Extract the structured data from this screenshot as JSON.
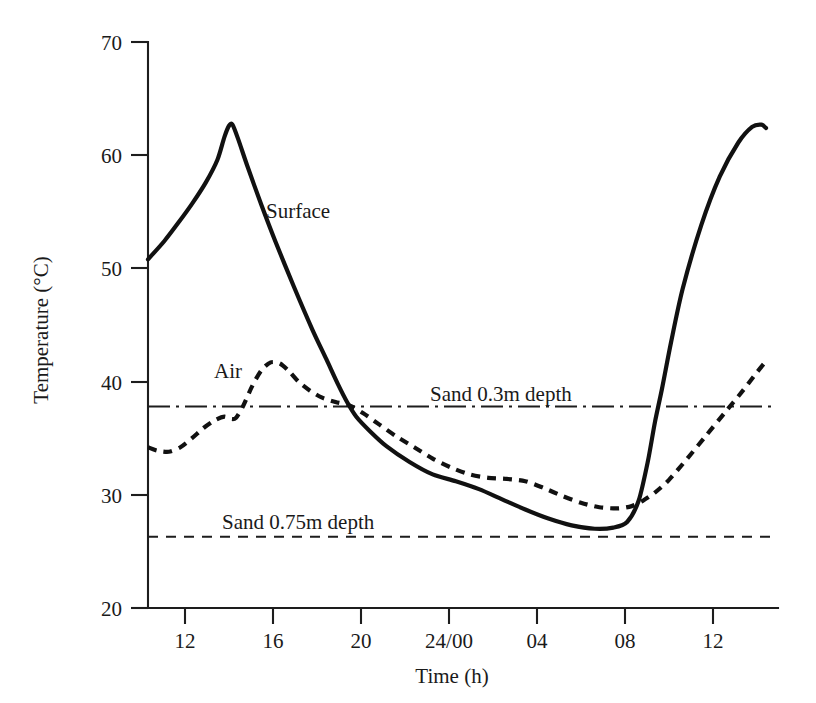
{
  "chart_data": {
    "type": "line",
    "title": "",
    "xlabel": "Time (h)",
    "ylabel": "Temperature (°C)",
    "xlim": [
      10.3,
      13.3
    ],
    "ylim": [
      20,
      70
    ],
    "grid": false,
    "legend": "inline-annotations",
    "x_tick_labels": [
      "12",
      "16",
      "20",
      "24/00",
      "04",
      "08",
      "12"
    ],
    "x_tick_hours": [
      12,
      16,
      20,
      24,
      28,
      32,
      36
    ],
    "y_tick_labels": [
      "20",
      "30",
      "40",
      "50",
      "60",
      "70"
    ],
    "y_tick_values": [
      20,
      30,
      40,
      50,
      60,
      70
    ],
    "series": [
      {
        "name": "Surface",
        "style": "solid",
        "label_text": "Surface",
        "x": [
          10.3,
          11.0,
          11.6,
          12.2,
          12.8,
          13.3,
          13.6,
          13.8,
          13.95,
          14.2,
          14.6,
          15.2,
          15.8,
          16.6,
          17.4,
          18.0,
          18.5,
          18.9,
          19.3,
          19.9,
          20.6,
          21.6,
          22.6,
          23.6,
          24.6,
          25.6,
          26.6,
          27.6,
          28.6,
          29.6,
          30.4,
          31.0,
          31.5,
          31.9,
          32.2,
          32.5,
          32.9,
          33.4,
          34.2,
          35.0,
          35.8,
          36.4,
          36.8,
          37.0
        ],
        "y": [
          50.8,
          52.4,
          54.0,
          55.7,
          57.6,
          59.6,
          61.6,
          62.6,
          62.7,
          61.4,
          59.0,
          55.6,
          52.4,
          48.4,
          44.6,
          42.0,
          39.8,
          38.2,
          36.9,
          35.6,
          34.3,
          32.9,
          31.8,
          31.2,
          30.5,
          29.6,
          28.7,
          27.9,
          27.3,
          27.0,
          27.1,
          27.6,
          29.5,
          33.0,
          36.4,
          39.3,
          43.5,
          48.2,
          53.8,
          58.1,
          61.1,
          62.5,
          62.7,
          62.4
        ]
      },
      {
        "name": "Air",
        "style": "dashed",
        "label_text": "Air",
        "x": [
          10.3,
          10.7,
          11.2,
          11.7,
          12.2,
          12.7,
          13.2,
          13.6,
          13.9,
          14.1,
          14.4,
          14.8,
          15.2,
          15.6,
          16.0,
          16.4,
          16.8,
          17.3,
          17.8,
          18.4,
          19.0,
          19.6,
          20.3,
          21.0,
          21.8,
          22.6,
          23.4,
          24.2,
          25.0,
          25.8,
          26.6,
          27.4,
          28.2,
          29.0,
          29.8,
          30.6,
          31.2,
          31.7,
          32.2,
          32.8,
          33.6,
          34.4,
          35.2,
          36.0,
          36.6,
          37.0
        ],
        "y": [
          34.2,
          33.9,
          33.8,
          34.2,
          35.0,
          35.9,
          36.6,
          36.9,
          36.7,
          36.8,
          37.8,
          39.6,
          41.0,
          41.7,
          41.6,
          40.9,
          40.0,
          39.2,
          38.6,
          38.2,
          37.9,
          37.2,
          36.2,
          35.2,
          34.2,
          33.2,
          32.4,
          31.8,
          31.5,
          31.4,
          31.2,
          30.6,
          29.9,
          29.3,
          28.9,
          28.8,
          29.0,
          29.5,
          30.2,
          31.3,
          33.2,
          35.2,
          37.2,
          39.2,
          40.8,
          41.8
        ]
      }
    ],
    "reference_lines": [
      {
        "name": "Sand 0.3m depth",
        "value": 37.8,
        "style": "dash-dot",
        "label_text": "Sand 0.3m depth"
      },
      {
        "name": "Sand 0.75m depth",
        "value": 26.3,
        "style": "dashed",
        "label_text": "Sand 0.75m depth"
      }
    ]
  },
  "annotations": {
    "surface_label": "Surface",
    "air_label": "Air",
    "sand03_label": "Sand 0.3m depth",
    "sand075_label": "Sand 0.75m depth"
  },
  "axes": {
    "y_title": "Temperature (°C)",
    "x_title": "Time (h)",
    "y_ticks": [
      "70",
      "60",
      "50",
      "40",
      "30",
      "20"
    ],
    "x_ticks": [
      "12",
      "16",
      "20",
      "24/00",
      "04",
      "08",
      "12"
    ]
  },
  "colors": {
    "ink": "#111111",
    "axis": "#1d1d1d",
    "background": "#ffffff"
  }
}
